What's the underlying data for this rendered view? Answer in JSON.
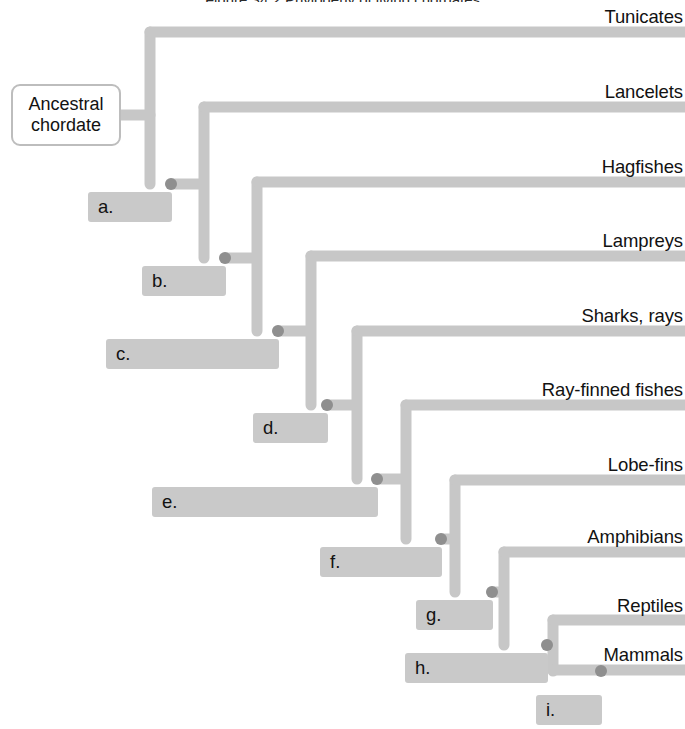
{
  "figure": {
    "title_clipped": "Figure 34.2 Phylogeny of living chordates",
    "root_label_line1": "Ancestral",
    "root_label_line2": "chordate"
  },
  "colors": {
    "branch": "#c7c7c7",
    "branch_edge": "#bdbdbd",
    "node_dot": "#8f8f8f",
    "callout_box": "#c9c9c9",
    "text": "#121212",
    "background": "#ffffff"
  },
  "tips": [
    {
      "id": "tunicates",
      "label": "Tunicates",
      "y": 32,
      "label_top": 8,
      "branch_x": 150
    },
    {
      "id": "lancelets",
      "label": "Lancelets",
      "y": 107,
      "label_top": 83,
      "branch_x": 204
    },
    {
      "id": "hagfishes",
      "label": "Hagfishes",
      "y": 182,
      "label_top": 158,
      "branch_x": 257
    },
    {
      "id": "lampreys",
      "label": "Lampreys",
      "y": 256,
      "label_top": 232,
      "branch_x": 311
    },
    {
      "id": "sharks-rays",
      "label": "Sharks, rays",
      "y": 331,
      "label_top": 307,
      "branch_x": 357
    },
    {
      "id": "ray-finned-fishes",
      "label": "Ray-finned fishes",
      "y": 405,
      "label_top": 381,
      "branch_x": 406
    },
    {
      "id": "lobe-fins",
      "label": "Lobe-fins",
      "y": 480,
      "label_top": 456,
      "branch_x": 455
    },
    {
      "id": "amphibians",
      "label": "Amphibians",
      "y": 552,
      "label_top": 528,
      "branch_x": 504
    },
    {
      "id": "reptiles",
      "label": "Reptiles",
      "y": 620,
      "label_top": 597,
      "branch_x": 553
    },
    {
      "id": "mammals",
      "label": "Mammals",
      "y": 670,
      "label_top": 646,
      "branch_x": 553
    }
  ],
  "nodes": [
    {
      "id": "a",
      "label": "a.",
      "x": 171,
      "y": 184,
      "box_left": 88,
      "box_width": 84,
      "box_top": 192
    },
    {
      "id": "b",
      "label": "b.",
      "x": 225,
      "y": 258,
      "box_left": 142,
      "box_width": 84,
      "box_top": 266
    },
    {
      "id": "c",
      "label": "c.",
      "x": 278,
      "y": 331,
      "box_left": 106,
      "box_width": 173,
      "box_top": 339
    },
    {
      "id": "d",
      "label": "d.",
      "x": 327,
      "y": 405,
      "box_left": 253,
      "box_width": 75,
      "box_top": 413
    },
    {
      "id": "e",
      "label": "e.",
      "x": 377,
      "y": 479,
      "box_left": 152,
      "box_width": 226,
      "box_top": 487
    },
    {
      "id": "f",
      "label": "f.",
      "x": 441,
      "y": 539,
      "box_left": 320,
      "box_width": 122,
      "box_top": 547
    },
    {
      "id": "g",
      "label": "g.",
      "x": 492,
      "y": 592,
      "box_left": 416,
      "box_width": 77,
      "box_top": 600
    },
    {
      "id": "h",
      "label": "h.",
      "x": 547,
      "y": 645,
      "box_left": 405,
      "box_width": 143,
      "box_top": 653
    },
    {
      "id": "i",
      "label": "i.",
      "x": 601,
      "y": 671,
      "box_left": 536,
      "box_width": 66,
      "box_top": 695
    }
  ],
  "root_stub": {
    "x1": 121,
    "x2": 150,
    "y": 115
  },
  "branch_paths": [
    {
      "id": "root-spine",
      "d": "M 150 32 L 150 184"
    },
    {
      "id": "node-a-to-b",
      "d": "M 171 184 L 204 184 L 204 107 M 204 184 L 204 258"
    },
    {
      "id": "spine-b",
      "d": "M 225 258 L 257 258 L 257 182 M 257 258 L 257 331"
    },
    {
      "id": "spine-c",
      "d": "M 278 331 L 311 331 L 311 256 M 311 331 L 311 405"
    },
    {
      "id": "spine-d",
      "d": "M 327 405 L 357 405 L 357 331 M 357 405 L 357 479"
    },
    {
      "id": "spine-e",
      "d": "M 377 479 L 406 479 L 406 405 M 406 479 L 406 539"
    },
    {
      "id": "spine-f",
      "d": "M 441 539 L 455 539 L 455 480 M 455 539 L 455 592"
    },
    {
      "id": "spine-g",
      "d": "M 492 592 L 504 592 L 504 552 M 504 592 L 504 645"
    },
    {
      "id": "spine-h",
      "d": "M 547 645 L 553 645 L 553 620 M 553 645 L 553 671"
    }
  ]
}
